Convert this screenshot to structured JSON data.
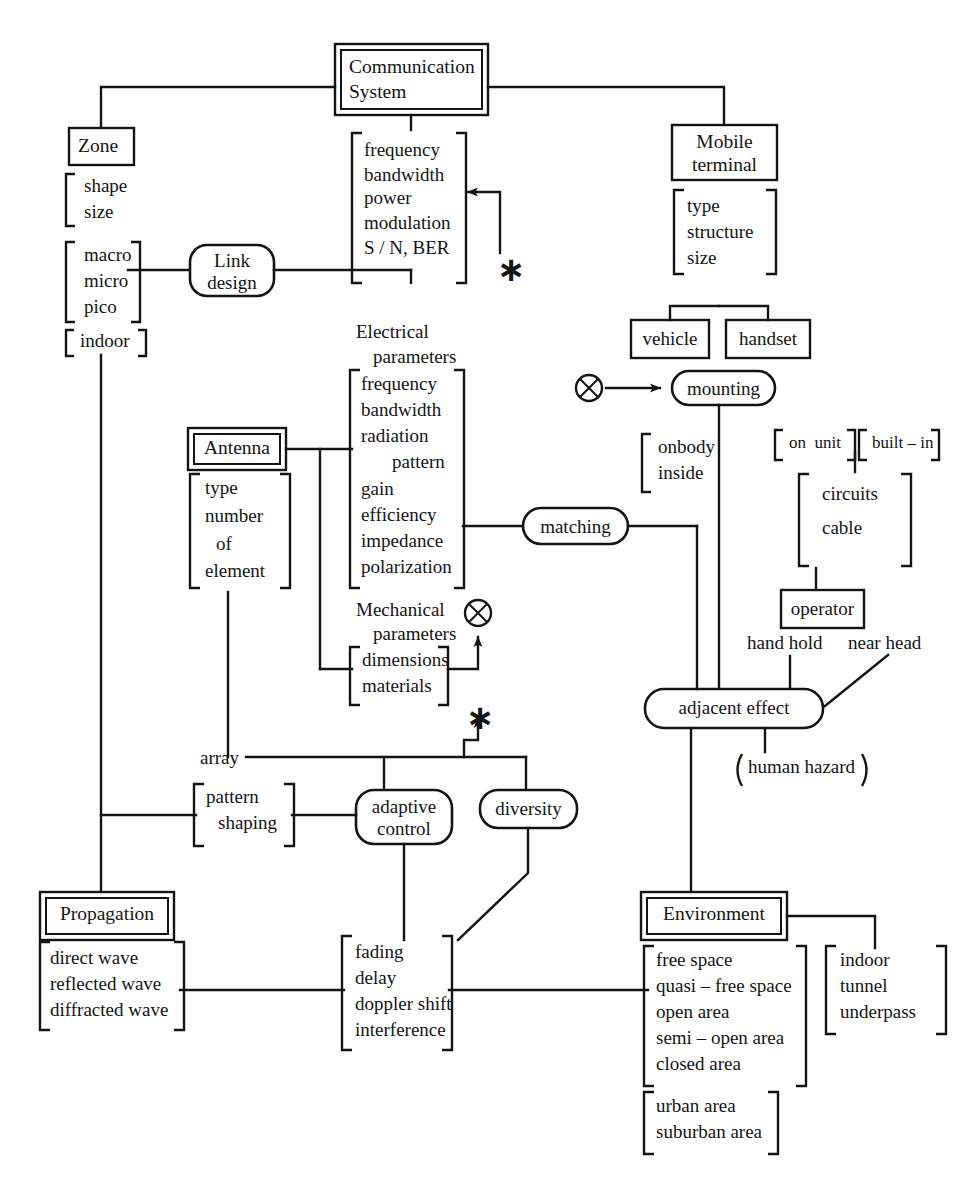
{
  "figure": {
    "type": "hierarchical block diagram",
    "root": "Communication System"
  },
  "nodes": {
    "root": "Communication System",
    "zone": "Zone",
    "mobile_terminal": "Mobile terminal",
    "mobile_terminal_l1": "Mobile",
    "mobile_terminal_l2": "terminal",
    "link_design_l1": "Link",
    "link_design_l2": "design",
    "antenna": "Antenna",
    "propagation": "Propagation",
    "environment": "Environment",
    "vehicle": "vehicle",
    "handset": "handset",
    "mounting": "mounting",
    "matching": "matching",
    "operator": "operator",
    "adjacent_effect": "adjacent effect",
    "human_hazard": "human hazard",
    "adaptive_control_l1": "adaptive",
    "adaptive_control_l2": "control",
    "diversity": "diversity",
    "array": "array"
  },
  "labels": {
    "electrical_parameters_l1": "Electrical",
    "electrical_parameters_l2": "parameters",
    "mechanical_parameters_l1": "Mechanical",
    "mechanical_parameters_l2": "parameters",
    "hand_hold": "hand hold",
    "near_head": "near head",
    "star_1": "∗",
    "star_2": "∗"
  },
  "brackets": {
    "zone_shape": [
      "shape",
      "size"
    ],
    "zone_scale": [
      "macro",
      "micro",
      "pico"
    ],
    "zone_indoor": [
      "indoor"
    ],
    "system_params": [
      "frequency",
      "bandwidth",
      "power",
      "modulation",
      "S / N, BER"
    ],
    "terminal_attrs": [
      "type",
      "structure",
      "size"
    ],
    "antenna_element": [
      "type",
      "number",
      "of",
      "element"
    ],
    "electrical_params": [
      "frequency",
      "bandwidth",
      "radiation",
      "pattern",
      "gain",
      "efficiency",
      "impedance",
      "polarization"
    ],
    "mechanical_params": [
      "dimensions",
      "materials"
    ],
    "mounting_body": [
      "onbody",
      "inside"
    ],
    "mounting_on_unit": [
      "on  unit"
    ],
    "mounting_built_in": [
      "built – in"
    ],
    "built_in_detail": [
      "circuits",
      "cable"
    ],
    "pattern_shaping": [
      "pattern",
      "shaping"
    ],
    "propagation_waves": [
      "direct wave",
      "reflected wave",
      "diffracted wave"
    ],
    "channel_effects": [
      "fading",
      "delay",
      "doppler shift",
      "interference"
    ],
    "environment_space": [
      "free space",
      "quasi – free space",
      "open area",
      "semi – open area",
      "closed area"
    ],
    "environment_urban": [
      "urban area",
      "suburban area"
    ],
    "environment_enclosed": [
      "indoor",
      "tunnel",
      "underpass"
    ],
    "human_hazard_paren": [
      "human hazard"
    ]
  },
  "colors": {
    "ink": "#141414",
    "background": "#ffffff"
  }
}
